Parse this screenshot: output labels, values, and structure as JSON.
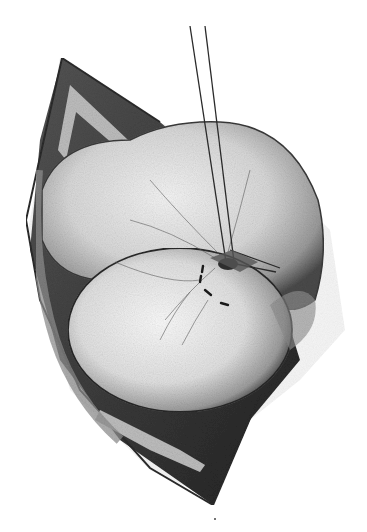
{
  "figure": {
    "kind": "surgical-illustration",
    "style": "grayscale pencil/stipple drawing",
    "colors": {
      "background": "#ffffff",
      "ink_dark": "#1a1a1a",
      "ink_mid": "#6b6b6b",
      "tissue_light": "#e8e8e8",
      "tissue_shadow": "#9a9a9a"
    },
    "elements": [
      "incision-wound",
      "retracted-skin-edges",
      "organ-upper-lobe",
      "organ-lower-lobe",
      "suture-threads",
      "suture-knot",
      "stitch-marks",
      "surface-vessels"
    ]
  }
}
